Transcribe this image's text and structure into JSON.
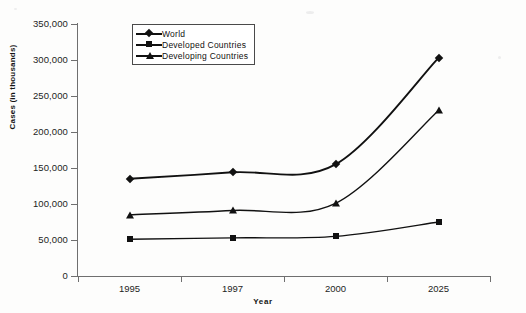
{
  "chart_data": {
    "type": "line",
    "title": "",
    "xlabel": "Year",
    "ylabel": "Cases (in thousands)",
    "categories": [
      "1995",
      "1997",
      "2000",
      "2025"
    ],
    "ylim": [
      0,
      350000
    ],
    "ytick_step": 50000,
    "ytick_labels": [
      "0",
      "50,000",
      "100,000",
      "150,000",
      "200,000",
      "250,000",
      "300,000",
      "350,000"
    ],
    "ytick_values": [
      0,
      50000,
      100000,
      150000,
      200000,
      250000,
      300000,
      350000
    ],
    "grid": false,
    "legend_position": "top-left-inside",
    "series": [
      {
        "name": "World",
        "marker": "diamond",
        "values": [
          135000,
          144000,
          155000,
          303000
        ]
      },
      {
        "name": "Developed Countries",
        "marker": "square",
        "values": [
          51000,
          53000,
          55000,
          75000
        ]
      },
      {
        "name": "Developing Countries",
        "marker": "triangle",
        "values": [
          85000,
          91000,
          101000,
          230000
        ]
      }
    ],
    "colors": {
      "line": "#111111",
      "axis": "#6f6f6f",
      "text": "#1d1d1d",
      "background": "#fdfdfc"
    }
  },
  "legend": {
    "items": [
      {
        "label": "World",
        "marker": "diamond-marker"
      },
      {
        "label": "Developed Countries",
        "marker": "square-marker"
      },
      {
        "label": "Developing Countries",
        "marker": "triangle-marker"
      }
    ]
  },
  "axes": {
    "y_title": "Cases (in thousands)",
    "x_title": "Year",
    "y_labels": [
      "350,000",
      "300,000",
      "250,000",
      "200,000",
      "150,000",
      "100,000",
      "50,000",
      "0"
    ],
    "x_labels": [
      "1995",
      "1997",
      "2000",
      "2025"
    ]
  }
}
